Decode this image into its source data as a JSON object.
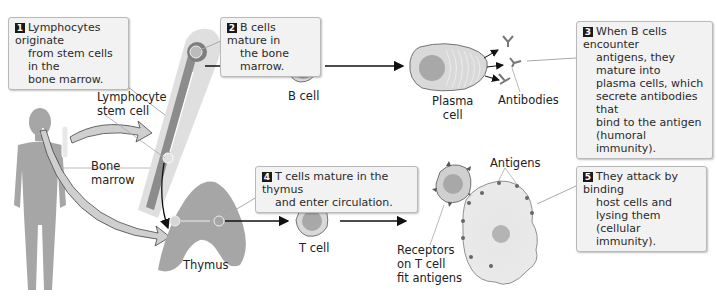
{
  "steps": [
    {
      "number": "1",
      "lines": [
        "Lymphocytes originate",
        "from stem cells in the",
        "bone marrow."
      ]
    },
    {
      "number": "2",
      "lines": [
        "B cells mature in",
        "the bone marrow."
      ]
    },
    {
      "number": "3",
      "lines": [
        "When B cells encounter",
        "antigens, they mature into",
        "plasma cells, which",
        "secrete antibodies that",
        "bind to the antigen",
        "(humoral immunity)."
      ]
    },
    {
      "number": "4",
      "lines": [
        "T cells mature in the thymus",
        "and enter circulation."
      ]
    },
    {
      "number": "5",
      "lines": [
        "They attack by binding",
        "host cells and lysing them",
        "(cellular immunity)."
      ]
    }
  ],
  "labels": {
    "stem_cell": [
      "Lymphocyte",
      "stem cell"
    ],
    "bone_marrow": [
      "Bone",
      "marrow"
    ],
    "b_cell": "B cell",
    "plasma_cell": [
      "Plasma",
      "cell"
    ],
    "antibodies": "Antibodies",
    "thymus": "Thymus",
    "t_cell": "T cell",
    "receptors": [
      "Receptors",
      "on T cell",
      "fit antigens"
    ],
    "antigens": "Antigens"
  },
  "colors": {
    "body": "#a6a6a6",
    "bone": "#d6d6d6",
    "marrow": "#8c8c8c",
    "cell_fill": "#d9d9d9",
    "nucleus": "#a8a8a8",
    "host_cell": "#e3e3e3",
    "callout_bg": "#f2f2f2",
    "badge": "#1a1a1a"
  }
}
